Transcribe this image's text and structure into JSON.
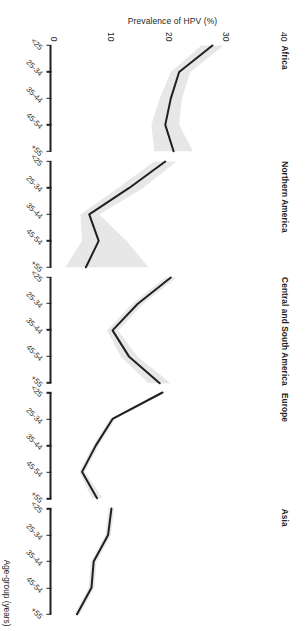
{
  "figure": {
    "orientation_note": "rotated-180",
    "y_axis_title": "Prevalence of HPV (%)",
    "x_axis_title": "Age-group (years)",
    "line_color": "#231f20",
    "band_color": "#d9d9d9",
    "background_color": "#ffffff"
  },
  "chart_data": {
    "type": "line",
    "title": "",
    "xlabel": "Age-group (years)",
    "ylabel": "Prevalence of HPV (%)",
    "categories": [
      "<25",
      "25-34",
      "35-44",
      "45-54",
      "+55"
    ],
    "ylim": [
      0,
      40
    ],
    "yticks": [
      0,
      10,
      20,
      30,
      40
    ],
    "ytick_labels": [
      "0",
      "10",
      "20",
      "30",
      "40"
    ],
    "grid": false,
    "legend": "none",
    "panel_layout": "small-multiples-row",
    "panels": [
      {
        "name": "Africa",
        "values": [
          29.0,
          23.0,
          21.5,
          20.5,
          22.0
        ],
        "ci_low": [
          27.0,
          21.5,
          19.5,
          18.0,
          18.5
        ],
        "ci_high": [
          31.0,
          25.0,
          23.5,
          23.0,
          25.5
        ]
      },
      {
        "name": "Northern America",
        "values": [
          20.5,
          14.0,
          6.8,
          8.5,
          6.2
        ],
        "ci_low": [
          18.5,
          12.0,
          5.2,
          5.5,
          2.5
        ],
        "ci_high": [
          22.5,
          16.5,
          8.6,
          13.5,
          17.5
        ]
      },
      {
        "name": "Central and South America",
        "values": [
          21.5,
          15.5,
          11.0,
          14.0,
          19.5
        ],
        "ci_low": [
          20.5,
          14.5,
          10.0,
          12.5,
          17.5
        ],
        "ci_high": [
          22.5,
          16.5,
          12.0,
          15.5,
          21.5
        ]
      },
      {
        "name": "Europe",
        "values": [
          20.0,
          11.0,
          8.0,
          5.5,
          8.2
        ],
        "ci_low": [
          19.5,
          10.5,
          7.5,
          5.0,
          7.3
        ],
        "ci_high": [
          20.5,
          11.5,
          8.5,
          6.0,
          9.2
        ]
      },
      {
        "name": "Asia",
        "values": [
          10.8,
          10.2,
          7.6,
          7.2,
          4.6
        ],
        "ci_low": [
          10.3,
          9.7,
          7.1,
          6.7,
          4.1
        ],
        "ci_high": [
          11.3,
          10.7,
          8.1,
          7.7,
          5.1
        ]
      }
    ]
  }
}
